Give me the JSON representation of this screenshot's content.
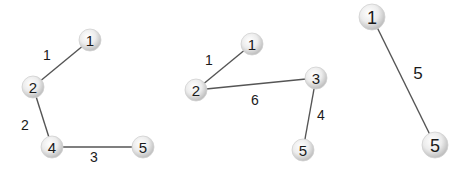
{
  "graphs": [
    {
      "id": "graph-1",
      "nodes": [
        {
          "id": "1",
          "label": "1",
          "x": 90,
          "y": 40
        },
        {
          "id": "2",
          "label": "2",
          "x": 33,
          "y": 87
        },
        {
          "id": "4",
          "label": "4",
          "x": 52,
          "y": 147
        },
        {
          "id": "5",
          "label": "5",
          "x": 143,
          "y": 147
        }
      ],
      "edges": [
        {
          "from": "1",
          "to": "2",
          "weight": "1",
          "lx": 47,
          "ly": 55
        },
        {
          "from": "2",
          "to": "4",
          "weight": "2",
          "lx": 25,
          "ly": 125
        },
        {
          "from": "4",
          "to": "5",
          "weight": "3",
          "lx": 94,
          "ly": 157
        }
      ]
    },
    {
      "id": "graph-2",
      "nodes": [
        {
          "id": "1",
          "label": "1",
          "x": 252,
          "y": 44
        },
        {
          "id": "2",
          "label": "2",
          "x": 196,
          "y": 90
        },
        {
          "id": "3",
          "label": "3",
          "x": 316,
          "y": 78
        },
        {
          "id": "5",
          "label": "5",
          "x": 303,
          "y": 150
        }
      ],
      "edges": [
        {
          "from": "1",
          "to": "2",
          "weight": "1",
          "lx": 209,
          "ly": 60
        },
        {
          "from": "2",
          "to": "3",
          "weight": "6",
          "lx": 255,
          "ly": 100
        },
        {
          "from": "3",
          "to": "5",
          "weight": "4",
          "lx": 321,
          "ly": 115
        }
      ]
    },
    {
      "id": "graph-3",
      "nodes": [
        {
          "id": "1",
          "label": "1",
          "x": 372,
          "y": 17
        },
        {
          "id": "5",
          "label": "5",
          "x": 435,
          "y": 145
        }
      ],
      "edges": [
        {
          "from": "1",
          "to": "5",
          "weight": "5",
          "lx": 418,
          "ly": 73
        }
      ]
    }
  ],
  "style": {
    "edge_color": "#555555",
    "node_fill_center": "#ffffff",
    "node_fill_edge": "#c8c8c8",
    "text_color": "#1a1a1a"
  }
}
